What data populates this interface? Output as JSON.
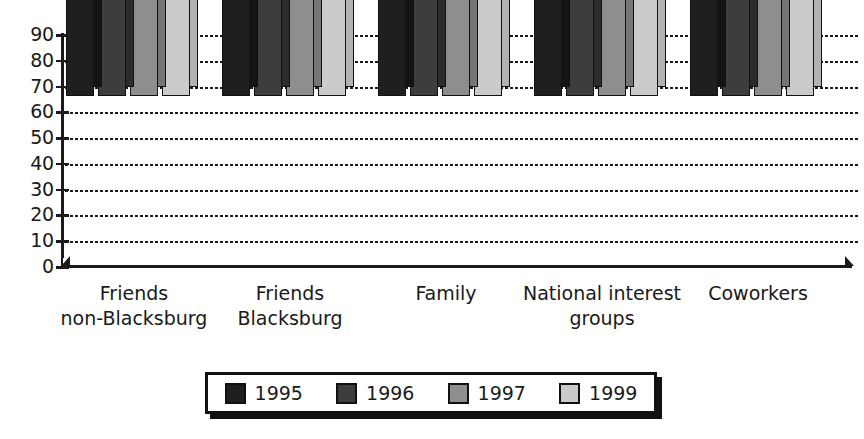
{
  "chart_data": {
    "type": "bar",
    "title": "",
    "xlabel": "",
    "ylabel": "",
    "ylim": [
      0,
      90
    ],
    "y_ticks": [
      90,
      80,
      70,
      60,
      50,
      40,
      30,
      20,
      10,
      0
    ],
    "grid": true,
    "grid_style": "dotted-horizontal",
    "legend_position": "bottom-center",
    "orientation": "vertical-grouped-3d",
    "categories": [
      "Friends non-Blacksburg",
      "Friends Blacksburg",
      "Family",
      "National interest groups",
      "Coworkers"
    ],
    "category_lines": [
      [
        "Friends",
        "non-Blacksburg"
      ],
      [
        "Friends",
        "Blacksburg"
      ],
      [
        "Family",
        ""
      ],
      [
        "National interest",
        "groups"
      ],
      [
        "Coworkers",
        ""
      ]
    ],
    "series": [
      {
        "name": "1995",
        "color": "#1f1f1f",
        "values": [
          59,
          47,
          46,
          45,
          38
        ]
      },
      {
        "name": "1996",
        "color": "#3d3d3d",
        "values": [
          51,
          45,
          47,
          39,
          39
        ]
      },
      {
        "name": "1997",
        "color": "#8e8e8e",
        "values": [
          75,
          66,
          72,
          41,
          55
        ]
      },
      {
        "name": "1999",
        "color": "#cbcbcb",
        "values": [
          80,
          61,
          63,
          48,
          54
        ]
      }
    ]
  },
  "legend": {
    "items": [
      {
        "label": "1995",
        "color": "#1f1f1f"
      },
      {
        "label": "1996",
        "color": "#3d3d3d"
      },
      {
        "label": "1997",
        "color": "#8e8e8e"
      },
      {
        "label": "1999",
        "color": "#cbcbcb"
      }
    ]
  },
  "colors": {
    "background": "#ffffff",
    "axis": "#1a1a1a",
    "gridline": "#1a1a1a",
    "outline": "#111111"
  }
}
